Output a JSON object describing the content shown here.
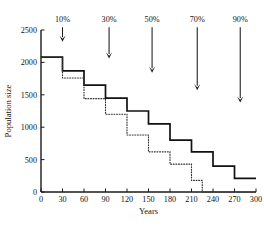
{
  "chart_data": {
    "type": "line",
    "title": "",
    "xlabel": "Years",
    "ylabel": "Population size",
    "xlim": [
      0,
      300
    ],
    "ylim": [
      0,
      2500
    ],
    "xticks": [
      0,
      30,
      60,
      90,
      120,
      150,
      180,
      210,
      240,
      270,
      300
    ],
    "yticks": [
      0,
      500,
      1000,
      1500,
      2000,
      2500
    ],
    "xtick_labels": [
      "0",
      "30",
      "60",
      "90",
      "120",
      "150",
      "180",
      "210",
      "240",
      "270",
      "300"
    ],
    "ytick_labels": [
      "0",
      "500",
      "1000",
      "1500",
      "2000",
      "2500"
    ],
    "grid": false,
    "legend": "none",
    "series": [
      {
        "name": "solid-step-curve",
        "style": "solid",
        "step": true,
        "x": [
          0,
          30,
          60,
          90,
          120,
          150,
          180,
          210,
          240,
          270,
          300
        ],
        "values": [
          2080,
          1870,
          1650,
          1450,
          1250,
          1050,
          800,
          620,
          400,
          210,
          210
        ]
      },
      {
        "name": "dotted-step-curve",
        "style": "dotted",
        "step": true,
        "x": [
          0,
          30,
          60,
          90,
          120,
          150,
          180,
          210,
          225,
          300
        ],
        "values": [
          2080,
          1760,
          1440,
          1200,
          880,
          620,
          430,
          180,
          0,
          0
        ]
      }
    ],
    "annotations": [
      {
        "label": "10%",
        "x": 30,
        "tip_value": 2320,
        "label_value": 2620
      },
      {
        "label": "30%",
        "x": 95,
        "tip_value": 2060,
        "label_value": 2620
      },
      {
        "label": "50%",
        "x": 155,
        "tip_value": 1840,
        "label_value": 2620
      },
      {
        "label": "70%",
        "x": 218,
        "tip_value": 1570,
        "label_value": 2620
      },
      {
        "label": "90%",
        "x": 278,
        "tip_value": 1380,
        "label_value": 2620
      }
    ]
  }
}
